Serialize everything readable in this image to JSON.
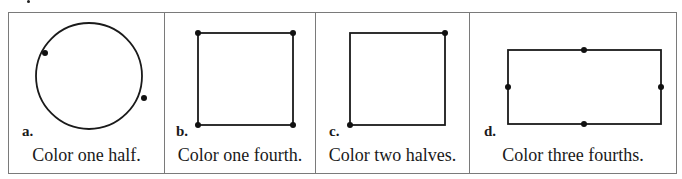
{
  "problems": [
    {
      "label": "a.",
      "shape": "circle",
      "instruction": "Color one half.",
      "marked_points": 2
    },
    {
      "label": "b.",
      "shape": "square",
      "instruction": "Color one fourth.",
      "marked_points": 4
    },
    {
      "label": "c.",
      "shape": "square",
      "instruction": "Color two halves.",
      "marked_points": 2
    },
    {
      "label": "d.",
      "shape": "rectangle",
      "instruction": "Color three fourths.",
      "marked_points": 4
    }
  ],
  "colors": {
    "line": "#1a1a1a",
    "border": "#7a7a7a"
  }
}
